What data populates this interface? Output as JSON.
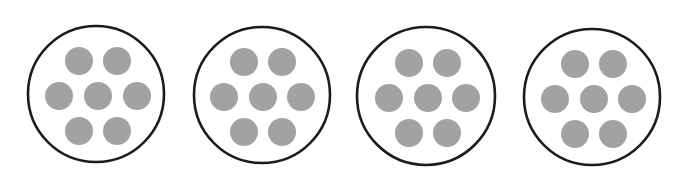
{
  "colors": {
    "background": "#ffffff",
    "outline": "#1c1c1c",
    "dot": "#a2a2a2"
  },
  "diagram": {
    "dots_per_circle": 7,
    "circles": [
      {
        "id": 1,
        "cx": 96,
        "cy": 94,
        "r": 68,
        "dots": [
          [
            79,
            61
          ],
          [
            117,
            61
          ],
          [
            59,
            96
          ],
          [
            98,
            96
          ],
          [
            137,
            96
          ],
          [
            79,
            131
          ],
          [
            117,
            131
          ]
        ]
      },
      {
        "id": 2,
        "cx": 262,
        "cy": 95,
        "r": 68,
        "dots": [
          [
            244,
            62
          ],
          [
            282,
            62
          ],
          [
            224,
            97
          ],
          [
            263,
            97
          ],
          [
            301,
            97
          ],
          [
            244,
            132
          ],
          [
            282,
            132
          ]
        ]
      },
      {
        "id": 3,
        "cx": 426,
        "cy": 96,
        "r": 69,
        "dots": [
          [
            409,
            63
          ],
          [
            447,
            63
          ],
          [
            389,
            98
          ],
          [
            428,
            98
          ],
          [
            466,
            98
          ],
          [
            409,
            133
          ],
          [
            447,
            133
          ]
        ]
      },
      {
        "id": 4,
        "cx": 592,
        "cy": 97,
        "r": 68,
        "dots": [
          [
            575,
            64
          ],
          [
            613,
            64
          ],
          [
            555,
            99
          ],
          [
            594,
            99
          ],
          [
            632,
            99
          ],
          [
            575,
            134
          ],
          [
            613,
            134
          ]
        ]
      }
    ],
    "dot_radius": 14,
    "outline_width": 2.6
  }
}
